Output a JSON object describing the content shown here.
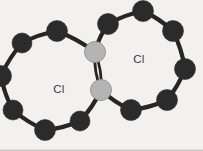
{
  "figure": {
    "kind": "molecular-structure-diagram",
    "width": 203,
    "height": 151,
    "background_color": "#f2f1ef",
    "border_color": "#b9b7b4",
    "atom_dark_color": "#2b2b2b",
    "atom_light_color": "#b4b4b4",
    "atom_light_outline": "#8e8e8e",
    "bond_color": "#262626",
    "label_color": "#3a3a3a"
  },
  "labels": {
    "left_ring": "Cl",
    "right_ring": "Cl"
  },
  "chart_data": {
    "type": "diagram",
    "title": "",
    "rings": [
      {
        "name": "left-ring",
        "label": "Cl",
        "label_position": [
          59,
          93
        ],
        "center": [
          56,
          79
        ],
        "radius": 44
      },
      {
        "name": "right-ring",
        "label": "Cl",
        "label_position": [
          139,
          63
        ],
        "center": [
          147,
          62
        ],
        "radius": 50
      }
    ],
    "atoms": [
      {
        "id": "L1",
        "ring": "left",
        "type": "dark",
        "x": 57,
        "y": 31,
        "r": 10.5
      },
      {
        "id": "L2",
        "ring": "left",
        "type": "dark",
        "x": 22,
        "y": 43,
        "r": 10.0
      },
      {
        "id": "L3",
        "ring": "left",
        "type": "dark",
        "x": 1,
        "y": 76,
        "r": 10.5
      },
      {
        "id": "L4",
        "ring": "left",
        "type": "dark",
        "x": 13,
        "y": 110,
        "r": 10.0
      },
      {
        "id": "L5",
        "ring": "left",
        "type": "dark",
        "x": 45,
        "y": 130,
        "r": 10.5
      },
      {
        "id": "L6",
        "ring": "left",
        "type": "dark",
        "x": 80,
        "y": 121,
        "r": 10.0
      },
      {
        "id": "J1",
        "ring": "shared",
        "type": "light",
        "x": 95,
        "y": 52,
        "r": 10.5
      },
      {
        "id": "J2",
        "ring": "shared",
        "type": "light",
        "x": 101,
        "y": 90,
        "r": 10.5
      },
      {
        "id": "R1",
        "ring": "right",
        "type": "dark",
        "x": 108,
        "y": 24,
        "r": 10.5
      },
      {
        "id": "R2",
        "ring": "right",
        "type": "dark",
        "x": 143,
        "y": 11,
        "r": 10.5
      },
      {
        "id": "R3",
        "ring": "right",
        "type": "dark",
        "x": 173,
        "y": 31,
        "r": 10.5
      },
      {
        "id": "R4",
        "ring": "right",
        "type": "dark",
        "x": 185,
        "y": 69,
        "r": 10.5
      },
      {
        "id": "R5",
        "ring": "right",
        "type": "dark",
        "x": 167,
        "y": 100,
        "r": 10.5
      },
      {
        "id": "R6",
        "ring": "right",
        "type": "dark",
        "x": 131,
        "y": 110,
        "r": 10.5
      }
    ],
    "bonds": [
      {
        "from": "L1",
        "to": "L2",
        "order": 1
      },
      {
        "from": "L2",
        "to": "L3",
        "order": 1
      },
      {
        "from": "L3",
        "to": "L4",
        "order": 1
      },
      {
        "from": "L4",
        "to": "L5",
        "order": 1
      },
      {
        "from": "L5",
        "to": "L6",
        "order": 1
      },
      {
        "from": "L6",
        "to": "J2",
        "order": 1
      },
      {
        "from": "J1",
        "to": "L1",
        "order": 1
      },
      {
        "from": "J1",
        "to": "J2",
        "order": 2
      },
      {
        "from": "J1",
        "to": "R1",
        "order": 1
      },
      {
        "from": "R1",
        "to": "R2",
        "order": 1
      },
      {
        "from": "R2",
        "to": "R3",
        "order": 1
      },
      {
        "from": "R3",
        "to": "R4",
        "order": 1
      },
      {
        "from": "R4",
        "to": "R5",
        "order": 1
      },
      {
        "from": "R5",
        "to": "R6",
        "order": 1
      },
      {
        "from": "R6",
        "to": "J2",
        "order": 1
      }
    ]
  }
}
